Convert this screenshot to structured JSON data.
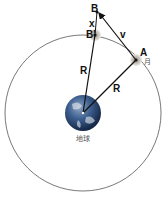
{
  "diagram": {
    "labels": {
      "B": "B",
      "B_prime": "B'",
      "A": "A",
      "x": "x",
      "v": "v",
      "R1": "R",
      "R2": "R",
      "moon": "月",
      "earth": "地球"
    },
    "colors": {
      "orbit": "#555555",
      "arrow": "#111111",
      "earth": "#2f4f7a",
      "moon": "#b5b0a8"
    }
  }
}
